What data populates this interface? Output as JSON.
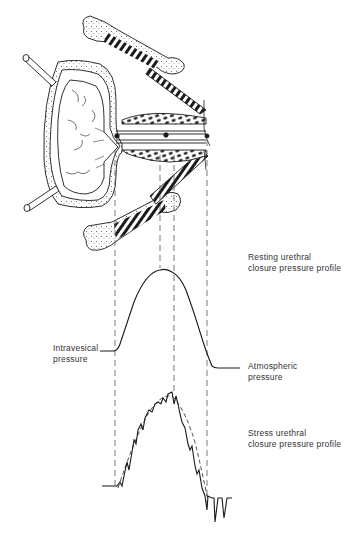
{
  "labels": {
    "resting": {
      "line1": "Resting urethral",
      "line2": "closure pressure profile"
    },
    "intravesical": {
      "line1": "Intravesical",
      "line2": "pressure"
    },
    "atmospheric": {
      "line1": "Atmospheric",
      "line2": "pressure"
    },
    "stress": {
      "line1": "Stress urethral",
      "line2": "closure pressure profile"
    }
  },
  "colors": {
    "ink": "#1a1a1a",
    "dash": "#555555",
    "text": "#333333"
  },
  "reference_lines_x": [
    115,
    160,
    174,
    207
  ],
  "curves": {
    "resting": {
      "baseline_left_y": 351,
      "peak_y": 270,
      "baseline_right_y": 367
    },
    "stress": {
      "baseline_left_y": 486,
      "peak_y": 393,
      "baseline_right_y": 498
    }
  }
}
